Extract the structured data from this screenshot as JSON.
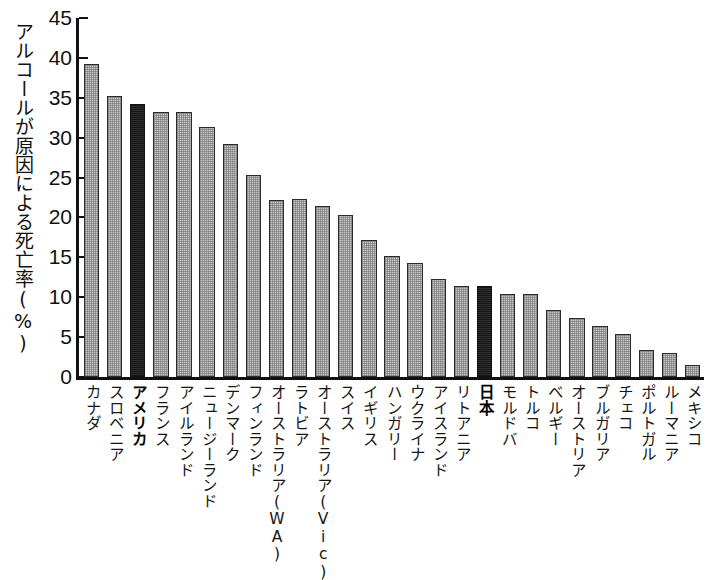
{
  "chart_data": {
    "type": "bar",
    "title": "",
    "subtitle": "",
    "xlabel": "",
    "ylabel": "アルコールが原因による死亡率(%)",
    "ylim": [
      0,
      45
    ],
    "ytick_step": 5,
    "ytick_labels": [
      "45",
      "40",
      "35",
      "30",
      "25",
      "20",
      "15",
      "10",
      "5",
      "0"
    ],
    "grid": false,
    "legend": "none",
    "categories": [
      "カナダ",
      "スロベニア",
      "アメリカ",
      "フランス",
      "アイルランド",
      "ニュージーランド",
      "デンマーク",
      "フィンランド",
      "オーストラリア(WA)",
      "ラトビア",
      "オーストラリア(Vic)",
      "スイス",
      "イギリス",
      "ハンガリー",
      "ウクライナ",
      "アイスランド",
      "リトアニア",
      "日本",
      "モルドバ",
      "トルコ",
      "ベルギー",
      "オーストリア",
      "ブルガリア",
      "チェコ",
      "ポルトガル",
      "ルーマニア",
      "メキシコ"
    ],
    "values": [
      39.2,
      35.2,
      34.2,
      33.2,
      33.2,
      31.3,
      29.2,
      25.3,
      22.2,
      22.3,
      21.4,
      20.3,
      17.2,
      15.2,
      14.3,
      12.3,
      11.4,
      11.4,
      10.4,
      10.4,
      8.4,
      7.4,
      6.4,
      5.4,
      3.4,
      3.0,
      1.5
    ],
    "highlighted_categories": [
      "アメリカ",
      "日本"
    ],
    "colors": {
      "bar_fill": "#c9c9c9",
      "bar_highlight": "#2e2e2e",
      "bar_stroke": "#2b2b2b",
      "axis": "#111111",
      "text": "#151515",
      "background": "#ffffff"
    }
  },
  "caption": ""
}
